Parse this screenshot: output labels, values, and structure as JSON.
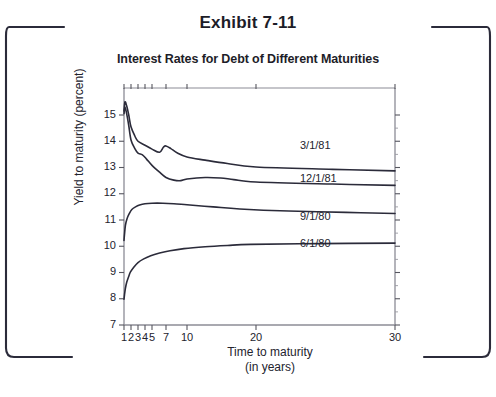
{
  "exhibit": {
    "title": "Exhibit 7-11"
  },
  "chart_data": {
    "type": "line",
    "title": "Interest Rates for Debt of Different Maturities",
    "xlabel": "Time to maturity",
    "xlabel_sub": "(in years)",
    "ylabel": "Yield to maturity (percent)",
    "xlim": [
      1,
      30
    ],
    "ylim": [
      7,
      15.9
    ],
    "xscale": "log-compressed",
    "grid": false,
    "legend_position": "inline-right",
    "xticks": [
      1,
      2,
      3,
      4,
      5,
      7,
      10,
      20,
      30
    ],
    "xtick_labels": [
      "1",
      "2",
      "3",
      "4",
      "5",
      "7",
      "10",
      "20",
      "30"
    ],
    "yticks": [
      7,
      8,
      9,
      10,
      11,
      12,
      13,
      14,
      15
    ],
    "ytick_labels": [
      "7",
      "8",
      "9",
      "10",
      "11",
      "12",
      "13",
      "14",
      "15"
    ],
    "line_color": "#2b2b3a",
    "series": [
      {
        "name": "3/1/81",
        "label": "3/1/81",
        "x": [
          1.0,
          1.1,
          1.3,
          1.6,
          2.0,
          2.5,
          3.0,
          4.0,
          5.0,
          6.0,
          6.6,
          7.0,
          7.6,
          8.5,
          10.0,
          12.0,
          15.0,
          20.0,
          25.0,
          30.0
        ],
        "values": [
          15.15,
          15.5,
          15.35,
          15.0,
          14.55,
          14.2,
          14.0,
          13.85,
          13.7,
          13.58,
          13.78,
          13.82,
          13.72,
          13.55,
          13.4,
          13.28,
          13.15,
          13.02,
          12.93,
          12.87
        ]
      },
      {
        "name": "12/1/81",
        "label": "12/1/81",
        "x": [
          1.0,
          1.1,
          1.3,
          1.6,
          2.0,
          2.5,
          3.0,
          3.6,
          4.2,
          5.0,
          6.0,
          7.0,
          8.0,
          9.0,
          10.0,
          12.0,
          14.0,
          16.0,
          20.0,
          25.0,
          30.0
        ],
        "values": [
          15.05,
          15.3,
          15.05,
          14.6,
          14.05,
          13.72,
          13.55,
          13.48,
          13.32,
          13.08,
          12.82,
          12.62,
          12.52,
          12.5,
          12.56,
          12.62,
          12.6,
          12.54,
          12.45,
          12.37,
          12.32
        ]
      },
      {
        "name": "9/1/80",
        "label": "9/1/80",
        "x": [
          1.0,
          1.05,
          1.15,
          1.35,
          1.7,
          2.1,
          2.6,
          3.2,
          4.0,
          5.0,
          6.5,
          8.0,
          10.0,
          13.0,
          17.0,
          22.0,
          26.0,
          30.0
        ],
        "values": [
          10.22,
          10.45,
          10.8,
          11.05,
          11.25,
          11.4,
          11.5,
          11.57,
          11.62,
          11.64,
          11.64,
          11.62,
          11.58,
          11.5,
          11.42,
          11.34,
          11.29,
          11.25
        ]
      },
      {
        "name": "6/1/80",
        "label": "6/1/80",
        "x": [
          1.0,
          1.05,
          1.15,
          1.3,
          1.55,
          1.9,
          2.4,
          3.0,
          3.8,
          4.8,
          6.0,
          7.5,
          9.5,
          12.0,
          15.0,
          19.0,
          24.0,
          30.0
        ],
        "values": [
          7.98,
          8.15,
          8.4,
          8.62,
          8.82,
          9.02,
          9.22,
          9.38,
          9.52,
          9.64,
          9.74,
          9.83,
          9.91,
          9.98,
          10.03,
          10.07,
          10.1,
          10.12
        ]
      }
    ]
  }
}
